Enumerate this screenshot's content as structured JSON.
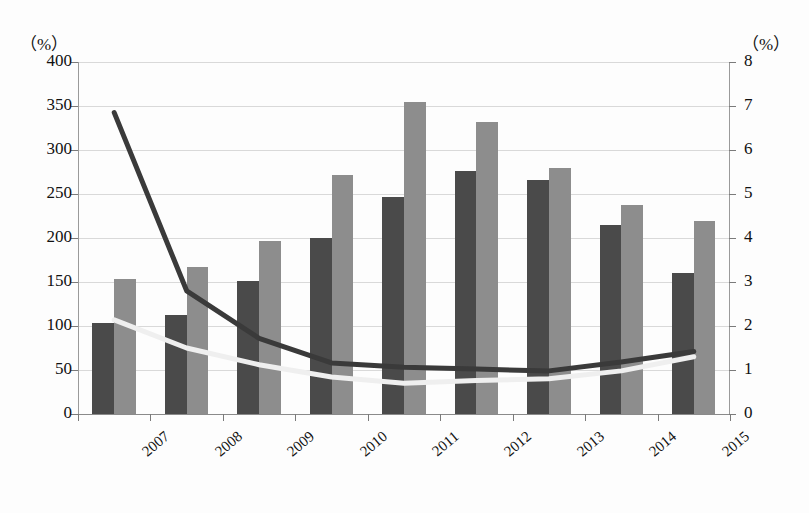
{
  "chart_data": {
    "type": "bar",
    "title": "",
    "subtitle": "",
    "xlabel": "",
    "ylabel": "",
    "categories": [
      "2007",
      "2008",
      "2009",
      "2010",
      "2011",
      "2012",
      "2013",
      "2014",
      "2015"
    ],
    "grid": true,
    "legend": "none",
    "left_axis": {
      "unit_label": "（%）",
      "min": 0,
      "max": 400,
      "step": 50,
      "ticks": [
        "0",
        "50",
        "100",
        "150",
        "200",
        "250",
        "300",
        "350",
        "400"
      ]
    },
    "right_axis": {
      "unit_label": "（%）",
      "min": 0,
      "max": 8,
      "step": 1,
      "ticks": [
        "0",
        "1",
        "2",
        "3",
        "4",
        "5",
        "6",
        "7",
        "8"
      ]
    },
    "series": [
      {
        "name": "bar-series-dark",
        "type": "bar",
        "axis": "left",
        "color": "#4a4a4a",
        "values": [
          103,
          113,
          151,
          200,
          247,
          276,
          266,
          215,
          160
        ]
      },
      {
        "name": "bar-series-light",
        "type": "bar",
        "axis": "left",
        "color": "#8d8d8d",
        "values": [
          153,
          167,
          197,
          272,
          355,
          332,
          280,
          238,
          219
        ]
      },
      {
        "name": "line-series-dark",
        "type": "line",
        "axis": "right",
        "color": "#3a3a3a",
        "values": [
          6.85,
          2.8,
          1.72,
          1.16,
          1.06,
          1.02,
          0.98,
          1.18,
          1.42
        ]
      },
      {
        "name": "line-series-light",
        "type": "line",
        "axis": "right",
        "color": "#efefef",
        "values": [
          2.14,
          1.5,
          1.12,
          0.84,
          0.7,
          0.76,
          0.8,
          0.98,
          1.3
        ]
      }
    ]
  }
}
